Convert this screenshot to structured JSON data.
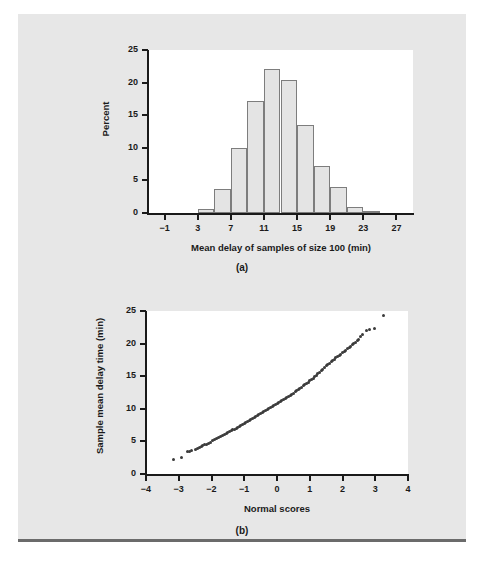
{
  "figure_a": {
    "caption": "(a)",
    "xlabel": "Mean delay of samples of size 100 (min)",
    "ylabel": "Percent",
    "chart_data": {
      "type": "bar",
      "title": "",
      "xlabel": "Mean delay of samples of size 100 (min)",
      "ylabel": "Percent",
      "xlim": [
        -3,
        29
      ],
      "ylim": [
        0,
        25
      ],
      "grid": false,
      "legend": "none",
      "xticks": [
        "-1",
        "3",
        "7",
        "11",
        "15",
        "19",
        "23",
        "27"
      ],
      "xtick_values": [
        -1,
        3,
        7,
        11,
        15,
        19,
        23,
        27
      ],
      "yticks": [
        "0",
        "5",
        "10",
        "15",
        "20",
        "25"
      ],
      "ytick_values": [
        0,
        5,
        10,
        15,
        20,
        25
      ],
      "bin_width": 2,
      "bin_starts": [
        1,
        3,
        5,
        7,
        9,
        11,
        13,
        15,
        17,
        19,
        21,
        23,
        25
      ],
      "categories": [
        "1-3",
        "3-5",
        "5-7",
        "7-9",
        "9-11",
        "11-13",
        "13-15",
        "15-17",
        "17-19",
        "19-21",
        "21-23",
        "23-25",
        "25-27"
      ],
      "values": [
        0.0,
        0.6,
        3.7,
        10.0,
        17.2,
        22.1,
        20.4,
        13.5,
        7.2,
        4.0,
        0.9,
        0.3,
        0.0
      ]
    }
  },
  "figure_b": {
    "caption": "(b)",
    "xlabel": "Normal scores",
    "ylabel": "Sample mean delay time (min)",
    "chart_data": {
      "type": "scatter",
      "title": "",
      "xlabel": "Normal scores",
      "ylabel": "Sample mean delay time (min)",
      "xlim": [
        -4,
        4
      ],
      "ylim": [
        0,
        25
      ],
      "grid": false,
      "legend": "none",
      "xticks": [
        "-4",
        "-3",
        "-2",
        "-1",
        "0",
        "1",
        "2",
        "3",
        "4"
      ],
      "xtick_values": [
        -4,
        -3,
        -2,
        -1,
        0,
        1,
        2,
        3,
        4
      ],
      "yticks": [
        "0",
        "5",
        "10",
        "15",
        "20",
        "25"
      ],
      "ytick_values": [
        0,
        5,
        10,
        15,
        20,
        25
      ],
      "points": [
        [
          -3.15,
          2.2
        ],
        [
          -2.92,
          2.6
        ],
        [
          -2.72,
          3.5
        ],
        [
          -2.66,
          3.5
        ],
        [
          -2.6,
          3.6
        ],
        [
          -2.5,
          3.8
        ],
        [
          -2.44,
          3.9
        ],
        [
          -2.38,
          4.0
        ],
        [
          -2.32,
          4.2
        ],
        [
          -2.26,
          4.3
        ],
        [
          -2.2,
          4.5
        ],
        [
          -2.14,
          4.6
        ],
        [
          -2.08,
          4.75
        ],
        [
          -2.02,
          4.9
        ],
        [
          -1.96,
          5.1
        ],
        [
          -1.9,
          5.25
        ],
        [
          -1.84,
          5.4
        ],
        [
          -1.78,
          5.55
        ],
        [
          -1.72,
          5.7
        ],
        [
          -1.66,
          5.85
        ],
        [
          -1.6,
          6.0
        ],
        [
          -1.55,
          6.15
        ],
        [
          -1.5,
          6.3
        ],
        [
          -1.45,
          6.45
        ],
        [
          -1.4,
          6.6
        ],
        [
          -1.35,
          6.75
        ],
        [
          -1.3,
          6.9
        ],
        [
          -1.25,
          7.05
        ],
        [
          -1.2,
          7.2
        ],
        [
          -1.15,
          7.35
        ],
        [
          -1.1,
          7.5
        ],
        [
          -1.05,
          7.62
        ],
        [
          -1.0,
          7.75
        ],
        [
          -0.95,
          7.9
        ],
        [
          -0.9,
          8.05
        ],
        [
          -0.85,
          8.2
        ],
        [
          -0.8,
          8.35
        ],
        [
          -0.75,
          8.5
        ],
        [
          -0.7,
          8.65
        ],
        [
          -0.65,
          8.8
        ],
        [
          -0.6,
          8.95
        ],
        [
          -0.55,
          9.1
        ],
        [
          -0.5,
          9.25
        ],
        [
          -0.45,
          9.4
        ],
        [
          -0.4,
          9.55
        ],
        [
          -0.35,
          9.7
        ],
        [
          -0.3,
          9.85
        ],
        [
          -0.25,
          10.0
        ],
        [
          -0.2,
          10.15
        ],
        [
          -0.15,
          10.3
        ],
        [
          -0.1,
          10.45
        ],
        [
          -0.05,
          10.6
        ],
        [
          0.0,
          10.8
        ],
        [
          0.05,
          10.95
        ],
        [
          0.1,
          11.1
        ],
        [
          0.15,
          11.25
        ],
        [
          0.2,
          11.4
        ],
        [
          0.25,
          11.6
        ],
        [
          0.3,
          11.75
        ],
        [
          0.35,
          11.9
        ],
        [
          0.4,
          12.1
        ],
        [
          0.45,
          12.25
        ],
        [
          0.5,
          12.4
        ],
        [
          0.55,
          12.6
        ],
        [
          0.6,
          12.75
        ],
        [
          0.65,
          12.95
        ],
        [
          0.7,
          13.1
        ],
        [
          0.75,
          13.3
        ],
        [
          0.8,
          13.5
        ],
        [
          0.85,
          13.7
        ],
        [
          0.9,
          13.9
        ],
        [
          0.95,
          14.1
        ],
        [
          1.0,
          14.3
        ],
        [
          1.05,
          14.5
        ],
        [
          1.1,
          14.7
        ],
        [
          1.15,
          14.9
        ],
        [
          1.2,
          15.1
        ],
        [
          1.25,
          15.35
        ],
        [
          1.3,
          15.6
        ],
        [
          1.35,
          15.9
        ],
        [
          1.4,
          16.1
        ],
        [
          1.45,
          16.35
        ],
        [
          1.5,
          16.6
        ],
        [
          1.55,
          16.8
        ],
        [
          1.6,
          17.0
        ],
        [
          1.65,
          17.2
        ],
        [
          1.7,
          17.4
        ],
        [
          1.75,
          17.6
        ],
        [
          1.8,
          17.8
        ],
        [
          1.85,
          18.0
        ],
        [
          1.9,
          18.2
        ],
        [
          1.95,
          18.4
        ],
        [
          2.0,
          18.6
        ],
        [
          2.05,
          18.8
        ],
        [
          2.1,
          19.0
        ],
        [
          2.15,
          19.2
        ],
        [
          2.2,
          19.4
        ],
        [
          2.25,
          19.6
        ],
        [
          2.3,
          19.8
        ],
        [
          2.35,
          20.0
        ],
        [
          2.4,
          20.2
        ],
        [
          2.45,
          20.4
        ],
        [
          2.5,
          20.6
        ],
        [
          2.55,
          21.1
        ],
        [
          2.62,
          21.4
        ],
        [
          2.74,
          22.0
        ],
        [
          2.82,
          22.1
        ],
        [
          2.98,
          22.3
        ],
        [
          3.24,
          24.3
        ]
      ]
    }
  }
}
